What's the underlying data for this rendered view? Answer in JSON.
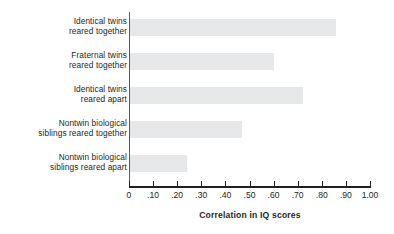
{
  "chart_data": {
    "type": "bar",
    "orientation": "horizontal",
    "title": "",
    "xlabel": "Correlation in IQ scores",
    "ylabel": "",
    "xlim": [
      0,
      1.0
    ],
    "grid": false,
    "legend": null,
    "categories": [
      "Identical twins reared together",
      "Fraternal twins reared together",
      "Identical twins reared apart",
      "Nontwin biological siblings reared together",
      "Nontwin biological siblings reared apart"
    ],
    "category_lines": [
      [
        "Identical twins",
        "reared together"
      ],
      [
        "Fraternal twins",
        "reared together"
      ],
      [
        "Identical twins",
        "reared apart"
      ],
      [
        "Nontwin biological",
        "siblings reared together"
      ],
      [
        "Nontwin biological",
        "siblings reared apart"
      ]
    ],
    "values": [
      0.86,
      0.6,
      0.72,
      0.47,
      0.24
    ],
    "tick_values": [
      0,
      0.1,
      0.2,
      0.3,
      0.4,
      0.5,
      0.6,
      0.7,
      0.8,
      0.9,
      1.0
    ],
    "tick_labels": [
      "0",
      ".10",
      ".20",
      ".30",
      ".40",
      ".50",
      ".60",
      ".70",
      ".80",
      ".90",
      "1.00"
    ],
    "bar_color": "#e6e7e8",
    "axis_color": "#231f20",
    "text_color": "#231f20",
    "background": "#ffffff"
  }
}
